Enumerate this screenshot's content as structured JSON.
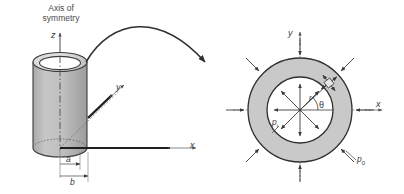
{
  "figure": {
    "title_text": "Thick-walled cylinder under internal and external pressure",
    "background_color": "#ffffff",
    "stroke_color": "#333333",
    "text_color": "#3a3a3a",
    "wall_fill_color": "#c9c9c9",
    "bore_fill_color": "#ffffff",
    "cylinder_fill_color": "#bdbdbd",
    "rim_fill_color": "#d8d8d8"
  },
  "left_view": {
    "name": "hollow-cylinder-3d",
    "axis_of_symmetry_label": "Axis of\nsymmetry",
    "axis_of_symmetry_line1": "Axis of",
    "axis_of_symmetry_line2": "symmetry",
    "axis_z_label": "z",
    "axis_y_label": "y",
    "axis_x_label": "x",
    "dimension_inner_label": "a",
    "dimension_outer_label": "b",
    "dimension_inner_meaning": "inner radius",
    "dimension_outer_meaning": "outer radius"
  },
  "right_view": {
    "name": "annular-cross-section",
    "axis_x_label": "x",
    "axis_y_label": "y",
    "radius_label": "r",
    "angle_label": "θ",
    "internal_pressure_label": "p",
    "internal_pressure_sub": "i",
    "external_pressure_label": "p",
    "external_pressure_sub": "0",
    "internal_pressure_arrow_direction": "outward",
    "external_pressure_arrow_direction": "inward",
    "internal_arrow_count": 8,
    "external_arrow_count": 8,
    "stress_element_angle_deg": 38
  },
  "connector": {
    "name": "callout-curve",
    "description": "curved arrow from cylinder top to cross-section"
  }
}
